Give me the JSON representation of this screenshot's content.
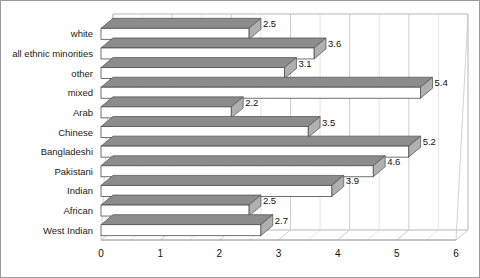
{
  "chart_data": {
    "type": "bar",
    "orientation": "horizontal",
    "style": "3d",
    "title": "",
    "subtitle": "",
    "xlabel": "",
    "ylabel": "",
    "xlim": [
      0,
      6
    ],
    "xticks": [
      "0",
      "1",
      "2",
      "3",
      "4",
      "5",
      "6"
    ],
    "xtick_minor_step": 0.5,
    "grid": true,
    "legend": false,
    "categories": [
      "white",
      "all ethnic minorities",
      "other",
      "mixed",
      "Arab",
      "Chinese",
      "Bangladeshi",
      "Pakistani",
      "Indian",
      "African",
      "West Indian"
    ],
    "values": [
      2.5,
      3.6,
      3.1,
      5.4,
      2.2,
      3.5,
      5.2,
      4.6,
      3.9,
      2.5,
      2.7
    ],
    "data_labels": [
      "2.5",
      "3.6",
      "3.1",
      "5.4",
      "2.2",
      "3.5",
      "5.2",
      "4.6",
      "3.9",
      "2.5",
      "2.7"
    ]
  },
  "colors": {
    "bar_front": "#ffffff",
    "bar_top": "#8c8c8c",
    "bar_cap": "#b0b0b0",
    "bar_outline": "#4d4d4d",
    "gridline": "#c8c8c8",
    "axis": "#8a8a8a",
    "text": "#111111",
    "border": "#9a9a9a",
    "background": "#ffffff"
  }
}
